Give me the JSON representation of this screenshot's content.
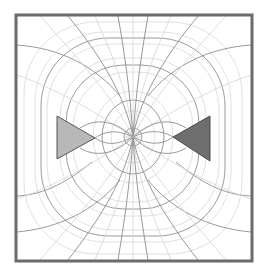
{
  "diagram": {
    "title": "",
    "type": "field-line mesh",
    "frame": {
      "x": 16,
      "y": 15,
      "width": 236,
      "height": 246,
      "stroke": "#6b6b6b",
      "stroke_width": 3
    },
    "colors": {
      "background": "#ffffff",
      "grid_light": "#d6d6d6",
      "grid_dark": "#8a8a8a",
      "left_triangle_fill": "#b8b8b8",
      "right_triangle_fill": "#6e6e6e",
      "triangle_stroke": "#555555"
    },
    "center": {
      "x": 133,
      "y": 137
    },
    "shapes": [
      {
        "name": "left-triangle",
        "points": "57,116 57,159 95,138"
      },
      {
        "name": "right-triangle",
        "points": "173,137 210,116 210,161"
      }
    ]
  }
}
